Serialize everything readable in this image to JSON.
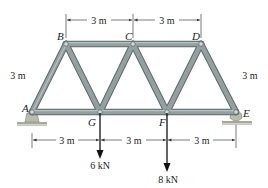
{
  "diagram": {
    "type": "truss",
    "colors": {
      "member_fill": "#8e9a9a",
      "member_edge": "#5e6a6a",
      "pin": "#c9cfcf",
      "support": "#b8b8a8",
      "ground": "#9a9a8a",
      "dim_line": "#333333",
      "load_arrow": "#111111"
    },
    "nodes": [
      {
        "id": "A",
        "label": "A",
        "x": 32,
        "y": 112
      },
      {
        "id": "B",
        "label": "B",
        "x": 66,
        "y": 44
      },
      {
        "id": "C",
        "label": "C",
        "x": 133,
        "y": 44
      },
      {
        "id": "D",
        "label": "D",
        "x": 201,
        "y": 44
      },
      {
        "id": "E",
        "label": "E",
        "x": 236,
        "y": 112
      },
      {
        "id": "F",
        "label": "F",
        "x": 167,
        "y": 112
      },
      {
        "id": "G",
        "label": "G",
        "x": 100,
        "y": 112
      }
    ],
    "members": [
      [
        "A",
        "B"
      ],
      [
        "B",
        "C"
      ],
      [
        "C",
        "D"
      ],
      [
        "D",
        "E"
      ],
      [
        "A",
        "G"
      ],
      [
        "G",
        "F"
      ],
      [
        "F",
        "E"
      ],
      [
        "B",
        "G"
      ],
      [
        "G",
        "C"
      ],
      [
        "C",
        "F"
      ],
      [
        "F",
        "D"
      ]
    ],
    "dimensions": {
      "top": [
        {
          "label": "3 m",
          "from": "B",
          "to": "C"
        },
        {
          "label": "3 m",
          "from": "C",
          "to": "D"
        }
      ],
      "bottom": [
        {
          "label": "3 m",
          "from": "A",
          "to": "G"
        },
        {
          "label": "3 m",
          "from": "G",
          "to": "F"
        },
        {
          "label": "3 m",
          "from": "F",
          "to": "E"
        }
      ],
      "left_side_label": "3 m",
      "right_side_label": "3 m"
    },
    "loads": [
      {
        "node": "G",
        "label": "6 kN",
        "direction": "down"
      },
      {
        "node": "F",
        "label": "8 kN",
        "direction": "down"
      }
    ],
    "supports": [
      {
        "node": "A",
        "type": "pin"
      },
      {
        "node": "E",
        "type": "roller"
      }
    ]
  }
}
